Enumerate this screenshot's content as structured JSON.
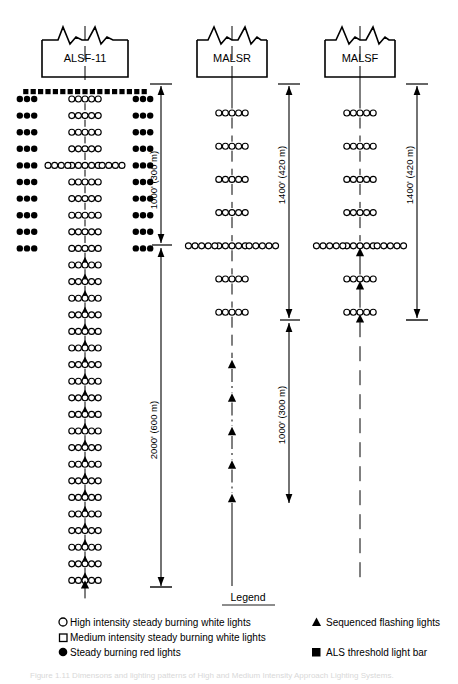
{
  "figure": {
    "systems": [
      {
        "id": "alsf-11",
        "name": "ALSF-11",
        "has_threshold_bar": true,
        "has_red_side_rows": true,
        "dimensions": [
          {
            "label": "1000' (300 m)"
          },
          {
            "label": "2000' (600 m)"
          }
        ],
        "center_rows": 30,
        "crossbar_row": 5,
        "flasher_start_row": 11,
        "lights_per_row": 5,
        "red_rows": 10,
        "red_lights_per_side": 3
      },
      {
        "id": "malsr",
        "name": "MALSR",
        "has_threshold_bar": false,
        "has_red_side_rows": false,
        "dimensions": [
          {
            "label": "1400' (420 m)"
          },
          {
            "label": "1000' (300 m)"
          }
        ],
        "center_rows": 7,
        "crossbar_row": 5,
        "flashers_below": 5,
        "lights_per_row": 5
      },
      {
        "id": "malsf",
        "name": "MALSF",
        "has_threshold_bar": false,
        "has_red_side_rows": false,
        "dimensions": [
          {
            "label": "1400' (420 m)"
          }
        ],
        "center_rows": 7,
        "crossbar_row": 5,
        "flasher_start_row": 5,
        "lights_per_row": 5
      }
    ],
    "legend": {
      "title": "Legend",
      "left_items": [
        {
          "symbol": "open-circle",
          "text": "High intensity steady burning white lights"
        },
        {
          "symbol": "open-square",
          "text": "Medium intensity steady burning white lights"
        },
        {
          "symbol": "filled-circle",
          "text": "Steady burning red lights"
        }
      ],
      "right_items": [
        {
          "symbol": "filled-triangle",
          "text": "Sequenced flashing lights"
        },
        {
          "symbol": "filled-square",
          "text": "ALS threshold light bar"
        }
      ]
    },
    "caption": "Figure 1.11  Dimensons and lighting patterns of High and Medium Intensity Approach Lighting Systems."
  }
}
